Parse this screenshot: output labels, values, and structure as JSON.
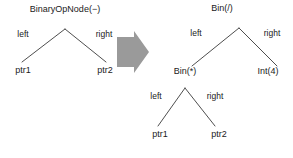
{
  "figure": {
    "background_color": "#ffffff",
    "line_color": "#3a3a3a",
    "text_color": "#1a1a1a",
    "arrow_color": "#9a9a9a"
  },
  "left_tree": {
    "root": {
      "label": "BinaryOpNode(−)",
      "x": 65,
      "y": 11
    },
    "edge_labels": [
      {
        "name": "left",
        "text": "left",
        "x": 23,
        "y": 34
      },
      {
        "name": "right",
        "text": "right",
        "x": 104,
        "y": 34
      }
    ],
    "leaves": [
      {
        "name": "ptr1",
        "label": "ptr1",
        "x": 23,
        "y": 70
      },
      {
        "name": "ptr2",
        "label": "ptr2",
        "x": 105,
        "y": 70
      }
    ],
    "edges": [
      {
        "from": "root",
        "to": "ptr1",
        "x1": 65,
        "y1": 29,
        "x2": 22,
        "y2": 62
      },
      {
        "from": "root",
        "to": "ptr2",
        "x1": 65,
        "y1": 29,
        "x2": 106,
        "y2": 62
      }
    ]
  },
  "arrow": {
    "name": "transform-arrow",
    "direction": "right",
    "color": "#9a9a9a",
    "x": 117,
    "y": 31,
    "width": 32,
    "height": 42
  },
  "right_tree": {
    "root": {
      "label": "Bin(/)",
      "x": 222,
      "y": 10
    },
    "edge_labels_top": [
      {
        "name": "left",
        "text": "left",
        "x": 196,
        "y": 33
      },
      {
        "name": "right",
        "text": "right",
        "x": 272,
        "y": 33
      }
    ],
    "inner_node": {
      "label": "Bin(*)",
      "x": 185,
      "y": 71
    },
    "leaf_int": {
      "label": "Int(4)",
      "x": 268,
      "y": 71
    },
    "edge_labels_bottom": [
      {
        "name": "left",
        "text": "left",
        "x": 156,
        "y": 96
      },
      {
        "name": "right",
        "text": "right",
        "x": 215,
        "y": 96
      }
    ],
    "leaves": [
      {
        "name": "ptr1",
        "label": "ptr1",
        "x": 160,
        "y": 134
      },
      {
        "name": "ptr2",
        "label": "ptr2",
        "x": 219,
        "y": 134
      }
    ],
    "edges": [
      {
        "from": "root",
        "to": "bin-mul",
        "x1": 239,
        "y1": 28,
        "x2": 192,
        "y2": 66
      },
      {
        "from": "root",
        "to": "int4",
        "x1": 239,
        "y1": 28,
        "x2": 277,
        "y2": 66
      },
      {
        "from": "bin-mul",
        "to": "ptr1",
        "x1": 185,
        "y1": 88,
        "x2": 158,
        "y2": 126
      },
      {
        "from": "bin-mul",
        "to": "ptr2",
        "x1": 185,
        "y1": 88,
        "x2": 215,
        "y2": 126
      }
    ]
  }
}
